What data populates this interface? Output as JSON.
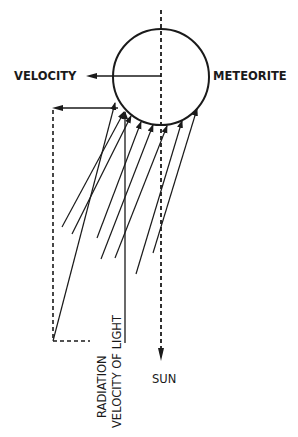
{
  "diagram": {
    "colors": {
      "background": "#ffffff",
      "ink": "#1a1a1a"
    },
    "labels": {
      "velocity": "VELOCITY",
      "meteorite": "METEORITE",
      "sun": "SUN",
      "radiation": "RADIATION",
      "velocity_of_light": "VELOCITY OF LIGHT"
    },
    "meteorite": {
      "center": [
        161,
        77
      ],
      "radius": 48
    },
    "sun_axis": {
      "x": 161,
      "from_y": 10,
      "to_y": 361,
      "style": "dashed",
      "arrow": "down"
    },
    "velocity_arrow": {
      "from": [
        161,
        76
      ],
      "to": [
        86,
        76
      ],
      "direction": "left"
    },
    "aberration_arrow": {
      "from": [
        118,
        108
      ],
      "to": [
        52,
        108
      ],
      "direction": "left"
    },
    "construction_dashed": [
      [
        [
          53,
          108
        ],
        [
          53,
          341
        ]
      ],
      [
        [
          53,
          341
        ],
        [
          90,
          341
        ]
      ]
    ],
    "radiation_rays": [
      {
        "from": [
          53,
          341
        ],
        "to": [
          115,
          103
        ]
      },
      {
        "from": [
          62,
          227
        ],
        "to": [
          124,
          112
        ]
      },
      {
        "from": [
          72,
          234
        ],
        "to": [
          131,
          116
        ]
      },
      {
        "from": [
          97,
          238
        ],
        "to": [
          141,
          122
        ]
      },
      {
        "from": [
          101,
          259
        ],
        "to": [
          153,
          125
        ]
      },
      {
        "from": [
          115,
          258
        ],
        "to": [
          167,
          126
        ]
      },
      {
        "from": [
          136,
          274
        ],
        "to": [
          182,
          121
        ]
      },
      {
        "from": [
          153,
          253
        ],
        "to": [
          197,
          109
        ]
      }
    ],
    "light_velocity_line": {
      "x": 125,
      "from_y": 343,
      "to_y": 112
    }
  }
}
